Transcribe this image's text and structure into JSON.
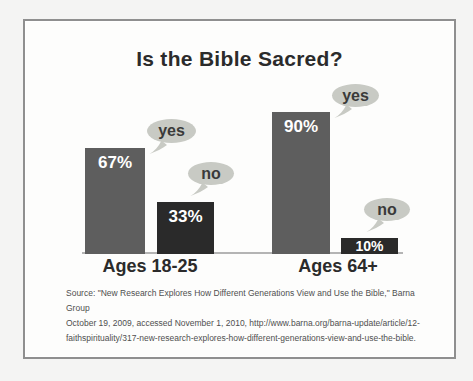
{
  "title": "Is the Bible Sacred?",
  "chart_data": {
    "type": "bar",
    "title": "Is the Bible Sacred?",
    "categories": [
      "Ages 18-25",
      "Ages 64+"
    ],
    "series": [
      {
        "name": "yes",
        "values": [
          67,
          90
        ]
      },
      {
        "name": "no",
        "values": [
          33,
          10
        ]
      }
    ],
    "bar_labels": [
      [
        "67%",
        "33%"
      ],
      [
        "90%",
        "10%"
      ]
    ],
    "ylim": [
      0,
      100
    ],
    "grid": false,
    "legend_position": "speech-bubble callout above each bar",
    "colors": {
      "yes_bar": "#5e5e5e",
      "no_bar": "#2a2a2a",
      "callout_bubble": "#c8cac4",
      "bar_value_text": "#ffffff",
      "text": "#2b2b2b"
    }
  },
  "source": {
    "lines": [
      "Source: \"New Research Explores How Different Generations View and Use the Bible,\" Barna Group",
      "October 19, 2009, accessed November 1, 2010, http://www.barna.org/barna-update/article/12-",
      "faithspirituality/317-new-research-explores-how-different-generations-view-and-use-the-bible."
    ]
  }
}
